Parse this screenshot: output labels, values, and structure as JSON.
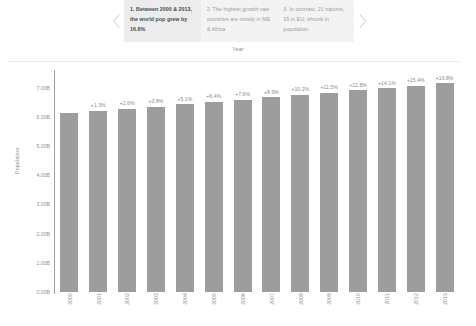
{
  "carousel": {
    "prev_icon": "chevron-left-icon",
    "next_icon": "chevron-right-icon",
    "cards": [
      {
        "text": "1. Between 2000 & 2013, the world pop grew by 16.8%",
        "active": true
      },
      {
        "text": "2. The highest growth rate countries are mostly in ME & Africa",
        "active": false
      },
      {
        "text": "3. In contrast, 21 nations, 15 in EU, shrunk in population",
        "active": false
      }
    ]
  },
  "colors": {
    "bar": "#9d9d9d",
    "card_active_bg": "#ececec",
    "card_bg": "#f3f3f3",
    "axis": "#9e9e9e",
    "text_muted": "#8f8f8f"
  },
  "chart_data": {
    "type": "bar",
    "title": "",
    "xlabel": "Year",
    "ylabel": "Population",
    "categories": [
      "2000",
      "2001",
      "2002",
      "2003",
      "2004",
      "2005",
      "2006",
      "2007",
      "2008",
      "2009",
      "2010",
      "2011",
      "2012",
      "2013"
    ],
    "values": [
      6.12,
      6.2,
      6.28,
      6.35,
      6.43,
      6.51,
      6.59,
      6.67,
      6.75,
      6.83,
      6.9,
      6.98,
      7.06,
      7.15
    ],
    "data_labels": [
      "",
      "+1.3%",
      "+2.6%",
      "+3.8%",
      "+5.1%",
      "+6.4%",
      "+7.6%",
      "+8.9%",
      "+10.2%",
      "+11.5%",
      "+12.8%",
      "+14.1%",
      "+15.4%",
      "+16.8%"
    ],
    "ylim": [
      0,
      7.6
    ],
    "yticks": [
      0,
      1,
      2,
      3,
      4,
      5,
      6,
      7
    ],
    "ytick_labels": [
      "0.00B",
      "1.00B",
      "2.00B",
      "3.00B",
      "4.00B",
      "5.00B",
      "6.00B",
      "7.00B"
    ],
    "grid": false,
    "legend": "none"
  }
}
